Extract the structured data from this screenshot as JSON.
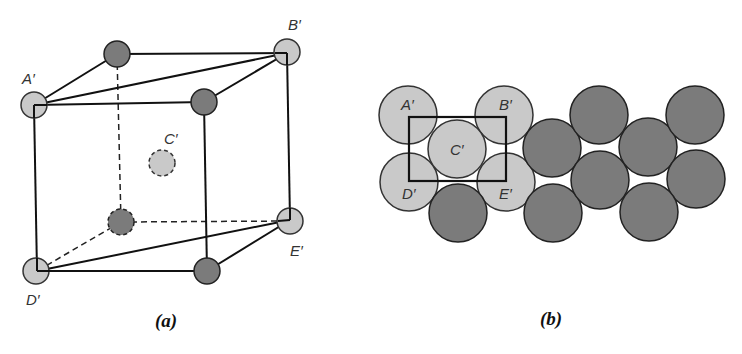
{
  "figure_a": {
    "caption": "(a)",
    "labels": {
      "A": "A′",
      "B": "B′",
      "C": "C′",
      "D": "D′",
      "E": "E′"
    },
    "atoms": [
      {
        "id": "A",
        "type": "light",
        "cx": 34,
        "cy": 105,
        "r": 13
      },
      {
        "id": "back-top-left",
        "type": "dark",
        "cx": 117,
        "cy": 54,
        "r": 13
      },
      {
        "id": "B",
        "type": "light",
        "cx": 287,
        "cy": 52,
        "r": 13
      },
      {
        "id": "front-top-right",
        "type": "dark",
        "cx": 204,
        "cy": 102,
        "r": 13
      },
      {
        "id": "C",
        "type": "light-hidden",
        "cx": 162,
        "cy": 163,
        "r": 13
      },
      {
        "id": "back-bottom-left",
        "type": "dark-hidden",
        "cx": 121,
        "cy": 222,
        "r": 13
      },
      {
        "id": "E",
        "type": "light",
        "cx": 290,
        "cy": 221,
        "r": 13
      },
      {
        "id": "D",
        "type": "light",
        "cx": 36,
        "cy": 271,
        "r": 13
      },
      {
        "id": "front-bottom-right",
        "type": "dark",
        "cx": 207,
        "cy": 271,
        "r": 13
      }
    ]
  },
  "figure_b": {
    "caption": "(b)",
    "labels": {
      "A": "A′",
      "B": "B′",
      "C": "C′",
      "D": "D′",
      "E": "E′"
    },
    "light_atoms": [
      {
        "id": "A",
        "cx": 408,
        "cy": 115
      },
      {
        "id": "B",
        "cx": 504,
        "cy": 115
      },
      {
        "id": "C",
        "cx": 457,
        "cy": 149
      },
      {
        "id": "D",
        "cx": 409,
        "cy": 182
      },
      {
        "id": "E",
        "cx": 506,
        "cy": 182
      }
    ],
    "dark_atoms": [
      {
        "cx": 458,
        "cy": 213
      },
      {
        "cx": 552,
        "cy": 148
      },
      {
        "cx": 599,
        "cy": 115
      },
      {
        "cx": 553,
        "cy": 213
      },
      {
        "cx": 600,
        "cy": 180
      },
      {
        "cx": 648,
        "cy": 147
      },
      {
        "cx": 695,
        "cy": 115
      },
      {
        "cx": 696,
        "cy": 179
      },
      {
        "cx": 649,
        "cy": 212
      }
    ],
    "radius": 29,
    "unit_cell_rect": {
      "x1": 409,
      "y1": 117,
      "x2": 506,
      "y2": 181
    }
  }
}
